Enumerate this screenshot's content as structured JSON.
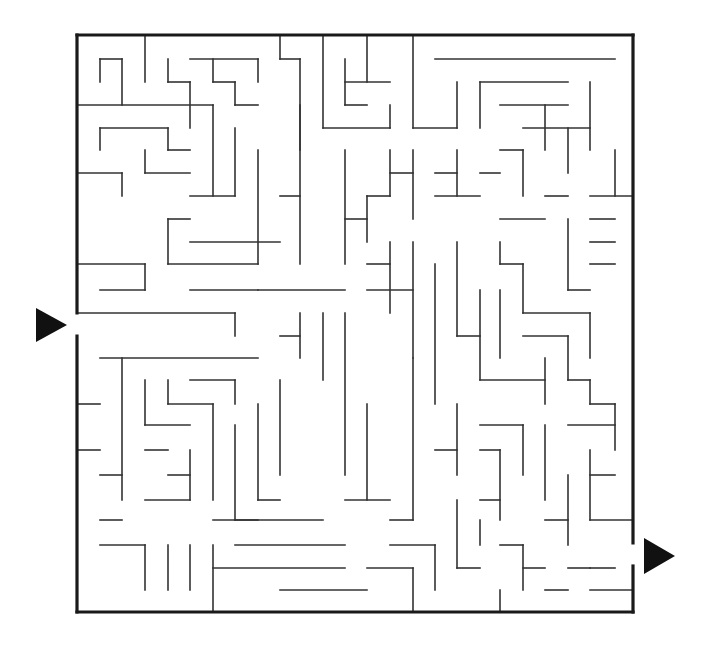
{
  "maze": {
    "reconstruction": "approximate",
    "note": "Outer frame, entrance, exit and grid geometry match the screenshot. Interior walls are a partial trace of the top-left region plus a representative set elsewhere; the full wall layout was not transcribed exactly.",
    "frame": {
      "left": 77,
      "top": 35,
      "right": 633,
      "bottom": 612
    },
    "cell_size": 22.6,
    "entrance": {
      "side": "left",
      "gap_top": 313,
      "gap_bottom": 336,
      "label": "start-arrow"
    },
    "exit": {
      "side": "right",
      "gap_top": 543,
      "gap_bottom": 566,
      "label": "finish-arrow"
    },
    "colors": {
      "wall": "#333333",
      "frame": "#1a1a1a",
      "arrow": "#111111",
      "background": "#ffffff"
    }
  },
  "interior_walls": [
    [
      100,
      59,
      100,
      82
    ],
    [
      100,
      59,
      122,
      59
    ],
    [
      122,
      59,
      122,
      105
    ],
    [
      145,
      35,
      145,
      82
    ],
    [
      168,
      59,
      168,
      82
    ],
    [
      168,
      82,
      190,
      82
    ],
    [
      190,
      82,
      190,
      128
    ],
    [
      190,
      59,
      258,
      59
    ],
    [
      213,
      59,
      213,
      82
    ],
    [
      213,
      82,
      235,
      82
    ],
    [
      235,
      82,
      235,
      105
    ],
    [
      235,
      105,
      258,
      105
    ],
    [
      258,
      59,
      258,
      82
    ],
    [
      77,
      105,
      213,
      105
    ],
    [
      100,
      128,
      100,
      150
    ],
    [
      100,
      128,
      168,
      128
    ],
    [
      168,
      128,
      168,
      150
    ],
    [
      168,
      150,
      190,
      150
    ],
    [
      77,
      173,
      122,
      173
    ],
    [
      122,
      173,
      122,
      196
    ],
    [
      145,
      150,
      145,
      173
    ],
    [
      145,
      173,
      190,
      173
    ],
    [
      213,
      105,
      213,
      196
    ],
    [
      190,
      196,
      235,
      196
    ],
    [
      235,
      128,
      235,
      196
    ],
    [
      280,
      35,
      280,
      59
    ],
    [
      280,
      59,
      300,
      59
    ],
    [
      300,
      59,
      300,
      150
    ],
    [
      323,
      35,
      323,
      128
    ],
    [
      323,
      128,
      390,
      128
    ],
    [
      345,
      59,
      345,
      105
    ],
    [
      345,
      105,
      367,
      105
    ],
    [
      367,
      35,
      367,
      82
    ],
    [
      345,
      82,
      390,
      82
    ],
    [
      390,
      105,
      390,
      128
    ],
    [
      413,
      35,
      413,
      128
    ],
    [
      413,
      128,
      457,
      128
    ],
    [
      457,
      82,
      457,
      128
    ],
    [
      435,
      59,
      615,
      59
    ],
    [
      480,
      82,
      480,
      128
    ],
    [
      480,
      82,
      568,
      82
    ],
    [
      258,
      150,
      258,
      264
    ],
    [
      280,
      196,
      300,
      196
    ],
    [
      300,
      105,
      300,
      264
    ],
    [
      190,
      242,
      280,
      242
    ],
    [
      168,
      219,
      190,
      219
    ],
    [
      168,
      219,
      168,
      264
    ],
    [
      168,
      264,
      258,
      264
    ],
    [
      77,
      264,
      145,
      264
    ],
    [
      145,
      264,
      145,
      290
    ],
    [
      100,
      290,
      145,
      290
    ],
    [
      190,
      290,
      258,
      290
    ],
    [
      258,
      290,
      345,
      290
    ],
    [
      323,
      313,
      323,
      380
    ],
    [
      77,
      313,
      235,
      313
    ],
    [
      235,
      313,
      235,
      336
    ],
    [
      100,
      358,
      258,
      358
    ],
    [
      122,
      358,
      122,
      500
    ],
    [
      145,
      380,
      145,
      425
    ],
    [
      145,
      425,
      190,
      425
    ],
    [
      168,
      380,
      168,
      404
    ],
    [
      168,
      404,
      213,
      404
    ],
    [
      213,
      404,
      213,
      500
    ],
    [
      190,
      380,
      235,
      380
    ],
    [
      235,
      380,
      235,
      404
    ],
    [
      77,
      404,
      100,
      404
    ],
    [
      77,
      450,
      100,
      450
    ],
    [
      100,
      475,
      122,
      475
    ],
    [
      145,
      450,
      168,
      450
    ],
    [
      168,
      475,
      190,
      475
    ],
    [
      190,
      450,
      190,
      500
    ],
    [
      145,
      500,
      190,
      500
    ],
    [
      235,
      425,
      235,
      520
    ],
    [
      235,
      520,
      258,
      520
    ],
    [
      258,
      404,
      258,
      500
    ],
    [
      258,
      500,
      280,
      500
    ],
    [
      280,
      380,
      280,
      475
    ],
    [
      280,
      336,
      300,
      336
    ],
    [
      300,
      313,
      300,
      358
    ],
    [
      213,
      520,
      323,
      520
    ],
    [
      100,
      520,
      122,
      520
    ],
    [
      100,
      545,
      145,
      545
    ],
    [
      145,
      545,
      145,
      590
    ],
    [
      168,
      545,
      168,
      590
    ],
    [
      190,
      545,
      190,
      590
    ],
    [
      213,
      545,
      213,
      612
    ],
    [
      213,
      568,
      345,
      568
    ],
    [
      235,
      545,
      345,
      545
    ],
    [
      280,
      590,
      367,
      590
    ],
    [
      345,
      313,
      345,
      475
    ],
    [
      367,
      404,
      367,
      500
    ],
    [
      345,
      500,
      390,
      500
    ],
    [
      390,
      242,
      390,
      313
    ],
    [
      367,
      264,
      390,
      264
    ],
    [
      367,
      290,
      413,
      290
    ],
    [
      413,
      242,
      413,
      358
    ],
    [
      413,
      358,
      413,
      520
    ],
    [
      390,
      520,
      413,
      520
    ],
    [
      390,
      545,
      435,
      545
    ],
    [
      435,
      545,
      435,
      590
    ],
    [
      367,
      568,
      413,
      568
    ],
    [
      413,
      568,
      413,
      612
    ],
    [
      435,
      264,
      435,
      404
    ],
    [
      457,
      242,
      457,
      336
    ],
    [
      457,
      336,
      480,
      336
    ],
    [
      480,
      290,
      480,
      380
    ],
    [
      480,
      380,
      545,
      380
    ],
    [
      545,
      358,
      545,
      404
    ],
    [
      523,
      336,
      568,
      336
    ],
    [
      500,
      290,
      500,
      358
    ],
    [
      500,
      264,
      523,
      264
    ],
    [
      523,
      264,
      523,
      313
    ],
    [
      523,
      313,
      590,
      313
    ],
    [
      590,
      313,
      590,
      358
    ],
    [
      568,
      336,
      568,
      380
    ],
    [
      568,
      380,
      590,
      380
    ],
    [
      590,
      380,
      590,
      404
    ],
    [
      457,
      404,
      457,
      475
    ],
    [
      435,
      450,
      457,
      450
    ],
    [
      480,
      425,
      523,
      425
    ],
    [
      523,
      425,
      523,
      475
    ],
    [
      545,
      425,
      545,
      500
    ],
    [
      568,
      425,
      615,
      425
    ],
    [
      590,
      404,
      615,
      404
    ],
    [
      615,
      404,
      615,
      450
    ],
    [
      480,
      450,
      500,
      450
    ],
    [
      500,
      450,
      500,
      520
    ],
    [
      480,
      500,
      500,
      500
    ],
    [
      457,
      500,
      457,
      568
    ],
    [
      457,
      568,
      480,
      568
    ],
    [
      480,
      520,
      480,
      545
    ],
    [
      500,
      545,
      523,
      545
    ],
    [
      523,
      545,
      523,
      590
    ],
    [
      523,
      568,
      545,
      568
    ],
    [
      545,
      520,
      568,
      520
    ],
    [
      568,
      475,
      568,
      545
    ],
    [
      590,
      450,
      590,
      520
    ],
    [
      590,
      475,
      615,
      475
    ],
    [
      590,
      520,
      633,
      520
    ],
    [
      568,
      568,
      590,
      568
    ],
    [
      590,
      568,
      615,
      568
    ],
    [
      590,
      590,
      633,
      590
    ],
    [
      500,
      590,
      500,
      612
    ],
    [
      545,
      590,
      568,
      590
    ],
    [
      545,
      105,
      545,
      150
    ],
    [
      500,
      105,
      568,
      105
    ],
    [
      523,
      128,
      590,
      128
    ],
    [
      568,
      128,
      568,
      173
    ],
    [
      590,
      82,
      590,
      150
    ],
    [
      500,
      150,
      523,
      150
    ],
    [
      523,
      150,
      523,
      196
    ],
    [
      480,
      173,
      500,
      173
    ],
    [
      457,
      150,
      457,
      196
    ],
    [
      435,
      173,
      457,
      173
    ],
    [
      435,
      196,
      480,
      196
    ],
    [
      413,
      150,
      413,
      219
    ],
    [
      390,
      173,
      413,
      173
    ],
    [
      390,
      150,
      390,
      196
    ],
    [
      367,
      196,
      390,
      196
    ],
    [
      367,
      196,
      367,
      242
    ],
    [
      345,
      219,
      367,
      219
    ],
    [
      345,
      150,
      345,
      264
    ],
    [
      500,
      219,
      545,
      219
    ],
    [
      545,
      196,
      568,
      196
    ],
    [
      568,
      219,
      568,
      290
    ],
    [
      568,
      290,
      590,
      290
    ],
    [
      590,
      219,
      615,
      219
    ],
    [
      590,
      242,
      615,
      242
    ],
    [
      615,
      150,
      615,
      196
    ],
    [
      590,
      196,
      633,
      196
    ],
    [
      590,
      264,
      615,
      264
    ],
    [
      500,
      242,
      500,
      264
    ]
  ]
}
